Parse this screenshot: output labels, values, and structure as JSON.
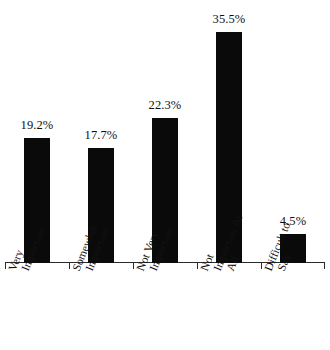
{
  "chart_data": {
    "type": "bar",
    "title": "",
    "xlabel": "",
    "ylabel": "",
    "categories": [
      "Very Important",
      "Somewhat Important",
      "Not Very Important",
      "Not Important At All",
      "Difficult to Say"
    ],
    "category_lines": [
      [
        "Very",
        "Important"
      ],
      [
        "Somewhat",
        "Important"
      ],
      [
        "Not Very",
        "Important"
      ],
      [
        "Not",
        "Important At",
        "All"
      ],
      [
        "Difficult to",
        "Say"
      ]
    ],
    "values": [
      19.2,
      17.7,
      22.3,
      35.5,
      4.5
    ],
    "value_labels": [
      "19.2%",
      "17.7%",
      "22.3%",
      "35.5%",
      "4.5%"
    ],
    "ylim": [
      0,
      40
    ],
    "grid": false,
    "legend": false,
    "bar_color": "#0a0a0a",
    "axis_color": "#2b2b2b",
    "background_color": "#ffffff"
  }
}
